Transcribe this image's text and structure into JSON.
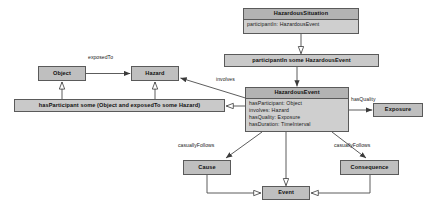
{
  "diagram": {
    "colors": {
      "node_fill": "#bfbfbf",
      "class_header_fill": "#b3b3b3",
      "class_body_fill": "#cfcfcf",
      "border": "#5a5a5a",
      "line": "#4a4a4a",
      "text": "#111111",
      "background": "#ffffff"
    },
    "nodes": [
      {
        "id": "hazardous-situation",
        "kind": "class",
        "title": "HazardousSituation",
        "attributes": [
          "participantIn: HazardousEvent"
        ],
        "x": 243,
        "y": 8,
        "w": 116,
        "h": 26
      },
      {
        "id": "participant-in-restriction",
        "kind": "restriction",
        "label": "participantIn some HazardousEvent",
        "x": 224,
        "y": 54,
        "w": 155,
        "h": 13
      },
      {
        "id": "object",
        "kind": "simple",
        "label": "Object",
        "x": 38,
        "y": 66,
        "w": 48,
        "h": 15
      },
      {
        "id": "hazard",
        "kind": "simple",
        "label": "Hazard",
        "x": 131,
        "y": 66,
        "w": 48,
        "h": 15
      },
      {
        "id": "has-participant-restriction",
        "kind": "restriction",
        "label": "hasParticipant some  (Object and exposedTo some Hazard)",
        "x": 14,
        "y": 99,
        "w": 211,
        "h": 13
      },
      {
        "id": "hazardous-event",
        "kind": "class",
        "title": "HazardousEvent",
        "attributes": [
          "hasParticipant: Object",
          "involves: Hazard",
          "hasQuality: Exposure",
          "hasDuration: TimeInterval"
        ],
        "x": 245,
        "y": 87,
        "w": 104,
        "h": 45
      },
      {
        "id": "exposure",
        "kind": "simple",
        "label": "Exposure",
        "x": 373,
        "y": 103,
        "w": 50,
        "h": 14
      },
      {
        "id": "cause",
        "kind": "simple",
        "label": "Cause",
        "x": 183,
        "y": 160,
        "w": 48,
        "h": 15
      },
      {
        "id": "consequence",
        "kind": "simple",
        "label": "Consequence",
        "x": 340,
        "y": 160,
        "w": 59,
        "h": 15
      },
      {
        "id": "event",
        "kind": "simple",
        "label": "Event",
        "x": 262,
        "y": 186,
        "w": 48,
        "h": 14
      }
    ],
    "edge_labels": [
      {
        "id": "exposed-to",
        "text": "exposedTo",
        "x": 88,
        "y": 58
      },
      {
        "id": "involves",
        "text": "involves",
        "x": 216,
        "y": 79
      },
      {
        "id": "has-quality",
        "text": "hasQuality",
        "x": 352,
        "y": 99
      },
      {
        "id": "casually-follows-left",
        "text": "casuallyFollows",
        "x": 180,
        "y": 144
      },
      {
        "id": "casually-follows-right",
        "text": "casuallyFollows",
        "x": 335,
        "y": 144
      }
    ],
    "edges": [
      {
        "id": "situation-to-restriction",
        "from": "hazardous-situation",
        "to": "participant-in-restriction",
        "arrow": "hollow-triangle"
      },
      {
        "id": "restriction-to-hazardous-event",
        "from": "participant-in-restriction",
        "to": "hazardous-event",
        "arrow": "solid"
      },
      {
        "id": "object-to-hazard",
        "from": "object",
        "to": "hazard",
        "arrow": "solid",
        "label": "exposedTo"
      },
      {
        "id": "hazardous-event-to-hazard",
        "from": "hazardous-event",
        "to": "hazard",
        "arrow": "solid",
        "label": "involves"
      },
      {
        "id": "hazardous-event-to-restriction",
        "from": "hazardous-event",
        "to": "has-participant-restriction",
        "arrow": "hollow-triangle"
      },
      {
        "id": "restriction-to-object",
        "from": "has-participant-restriction",
        "to": "object",
        "arrow": "hollow-triangle"
      },
      {
        "id": "restriction-to-hazard",
        "from": "has-participant-restriction",
        "to": "hazard",
        "arrow": "hollow-triangle"
      },
      {
        "id": "hazardous-event-to-exposure",
        "from": "hazardous-event",
        "to": "exposure",
        "arrow": "solid",
        "label": "hasQuality"
      },
      {
        "id": "hazardous-event-to-cause",
        "from": "hazardous-event",
        "to": "cause",
        "arrow": "solid",
        "label": "casuallyFollows"
      },
      {
        "id": "hazardous-event-to-consequence",
        "from": "hazardous-event",
        "to": "consequence",
        "arrow": "solid",
        "label": "casuallyFollows"
      },
      {
        "id": "hazardous-event-to-event",
        "from": "hazardous-event",
        "to": "event",
        "arrow": "hollow-triangle"
      },
      {
        "id": "cause-to-event",
        "from": "cause",
        "to": "event",
        "arrow": "hollow-triangle"
      },
      {
        "id": "consequence-to-event",
        "from": "consequence",
        "to": "event",
        "arrow": "hollow-triangle"
      }
    ]
  }
}
